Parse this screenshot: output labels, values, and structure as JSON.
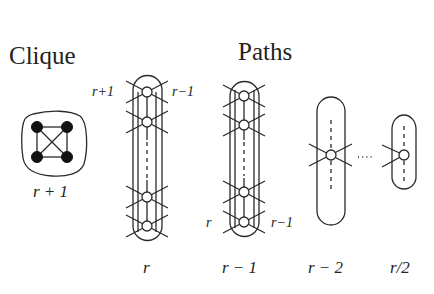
{
  "titles": {
    "clique": "Clique",
    "paths": "Paths"
  },
  "clique": {
    "label": "r + 1",
    "node_count": 4,
    "node_style": "filled"
  },
  "paths": [
    {
      "id": "r",
      "label": "r",
      "top_left_label": "r+1",
      "top_right_label": "r−1",
      "node_count_visible": 4
    },
    {
      "id": "r-1",
      "label": "r − 1",
      "bottom_left_label": "r",
      "bottom_right_label": "r−1",
      "node_count_visible": 4
    },
    {
      "id": "r-2",
      "label": "r − 2",
      "node_count_visible": 1
    },
    {
      "id": "r/2",
      "label": "r/2",
      "node_count_visible": 1
    }
  ],
  "ellipsis": "···",
  "colors": {
    "stroke": "#2a2a2a",
    "filled_node": "#111111",
    "background": "#ffffff"
  }
}
